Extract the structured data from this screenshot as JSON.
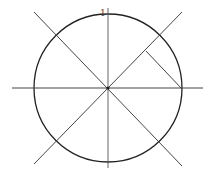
{
  "diagram": {
    "labels": {
      "top": "1"
    },
    "colors": {
      "stroke": "#333333",
      "circle": "#222222",
      "background": "#ffffff"
    },
    "circle": {
      "cx": 108,
      "cy": 88,
      "r": 74
    },
    "lines": [
      {
        "name": "horizontal-axis",
        "x1": 12,
        "y1": 88,
        "x2": 203,
        "y2": 88
      },
      {
        "name": "vertical-axis",
        "x1": 108,
        "y1": 8,
        "x2": 108,
        "y2": 168
      },
      {
        "name": "diagonal-descending",
        "x1": 34,
        "y1": 12,
        "x2": 182,
        "y2": 166
      },
      {
        "name": "diagonal-ascending",
        "x1": 34,
        "y1": 164,
        "x2": 182,
        "y2": 12
      },
      {
        "name": "perpendicular-segment",
        "x1": 146,
        "y1": 51,
        "x2": 182,
        "y2": 89
      }
    ]
  }
}
